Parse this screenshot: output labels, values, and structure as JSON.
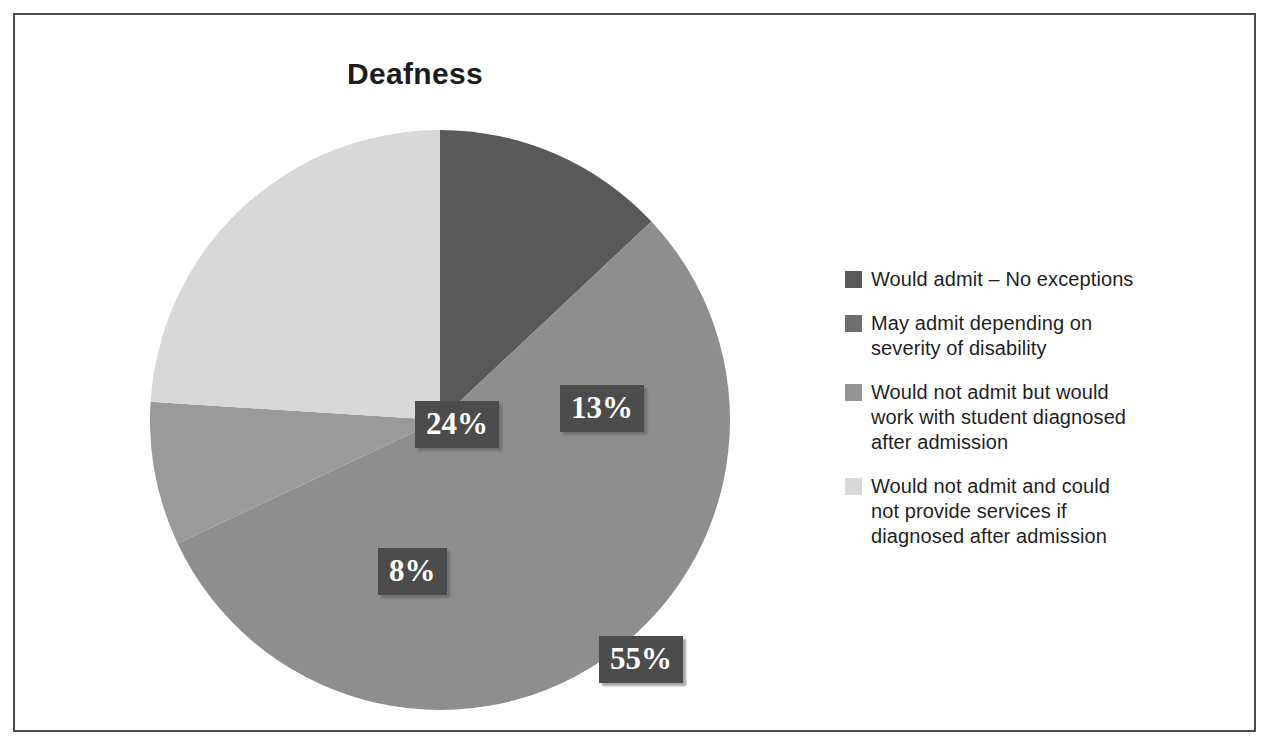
{
  "figure": {
    "title": "Deafness",
    "border_color": "#4a4a4a",
    "background": "#ffffff"
  },
  "chart_data": {
    "type": "pie",
    "title": "Deafness",
    "xlabel": "",
    "ylabel": "",
    "grid": false,
    "legend_position": "right",
    "start_angle_deg": 0,
    "direction": "clockwise",
    "unit": "percent",
    "categories": [
      "Would admit – No exceptions",
      "May admit depending on severity of disability",
      "Would not admit but would work with student diagnosed after admission",
      "Would not admit and could not provide services if diagnosed after admission"
    ],
    "values": [
      13,
      55,
      8,
      24
    ],
    "labels": [
      "13%",
      "55%",
      "8%",
      "24%"
    ],
    "colors": [
      "#595959",
      "#8e8e8e",
      "#9a9a9a",
      "#d8d8d8"
    ]
  },
  "slices": [
    {
      "label": "13%",
      "value": 13,
      "color": "#595959"
    },
    {
      "label": "55%",
      "value": 55,
      "color": "#8e8e8e"
    },
    {
      "label": "8%",
      "value": 8,
      "color": "#9a9a9a"
    },
    {
      "label": "24%",
      "value": 24,
      "color": "#d8d8d8"
    }
  ],
  "legend": {
    "items": [
      {
        "text": "Would admit – No exceptions",
        "swatch_color": "#595959"
      },
      {
        "text": "May admit depending on\nseverity of disability",
        "swatch_color": "#6e6e6e"
      },
      {
        "text": "Would not admit but would\nwork with student diagnosed\nafter admission",
        "swatch_color": "#949494"
      },
      {
        "text": "Would not admit and could\nnot provide services if\ndiagnosed after admission",
        "swatch_color": "#d8d8d8"
      }
    ]
  },
  "label_style": {
    "text_color": "#ffffff",
    "box_color": "#4c4c4c"
  }
}
